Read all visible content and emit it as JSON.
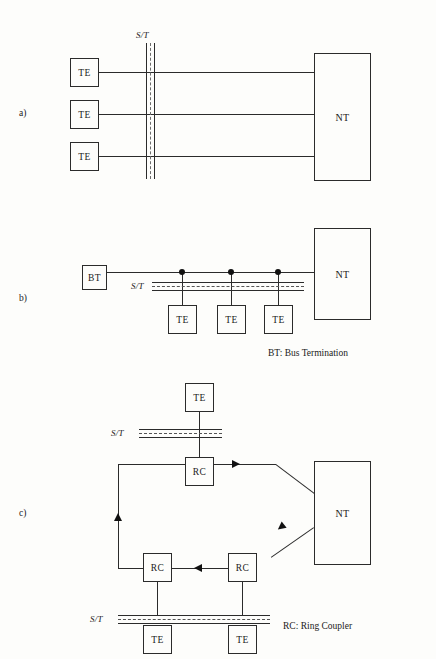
{
  "figure": {
    "kind": "isdn-reference-configurations",
    "top_partial_header": "",
    "panels": [
      {
        "id": "a",
        "label": "a)",
        "topology": "point-to-point",
        "st_label": "S/T",
        "terminals": [
          "TE",
          "TE",
          "TE"
        ],
        "network_node": "NT"
      },
      {
        "id": "b",
        "label": "b)",
        "topology": "passive-bus",
        "st_label": "S/T",
        "bus_termination": "BT",
        "terminals": [
          "TE",
          "TE",
          "TE"
        ],
        "network_node": "NT",
        "legend": "BT: Bus Termination"
      },
      {
        "id": "c",
        "label": "c)",
        "topology": "ring",
        "st_labels": [
          "S/T",
          "S/T"
        ],
        "couplers": [
          "RC",
          "RC",
          "RC"
        ],
        "terminals": [
          "TE",
          "TE",
          "TE"
        ],
        "network_node": "NT",
        "legend": "RC: Ring Coupler"
      }
    ]
  },
  "colors": {
    "ink": "#2b2b2b",
    "paper": "#fdfdfb",
    "dashdot": "#555555"
  }
}
